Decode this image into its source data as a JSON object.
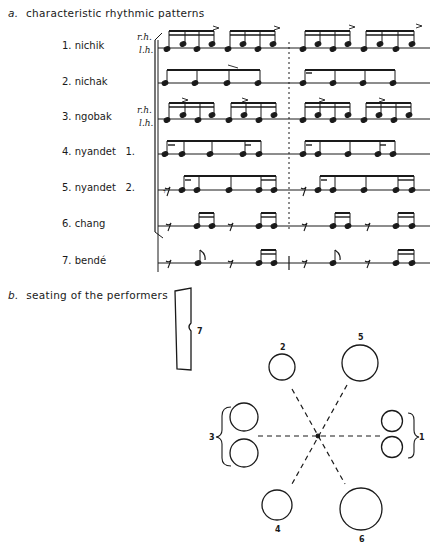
{
  "section_a": {
    "letter": "a.",
    "title": "characteristic rhythmic patterns"
  },
  "section_b": {
    "letter": "b.",
    "title": "seating of the performers"
  },
  "instruments": [
    {
      "number": "1.",
      "name": "nichik",
      "label": "1. nichik",
      "hands": [
        "r.h.",
        "l.h."
      ],
      "staff_y": 48
    },
    {
      "number": "2.",
      "name": "nichak",
      "label": "2. nichak",
      "hands": [],
      "staff_y": 83
    },
    {
      "number": "3.",
      "name": "ngobak",
      "label": "3. ngobak",
      "hands": [
        "r.h.",
        "l.h."
      ],
      "staff_y": 119
    },
    {
      "number": "4.",
      "name": "nyandet 1.",
      "label": "4. nyandet   1.",
      "hands": [],
      "staff_y": 154
    },
    {
      "number": "5.",
      "name": "nyandet 2.",
      "label": "5. nyandet   2.",
      "hands": [],
      "staff_y": 190
    },
    {
      "number": "6.",
      "name": "chang",
      "label": "6. chang",
      "hands": [],
      "staff_y": 226
    },
    {
      "number": "7.",
      "name": "bendé",
      "label": "7. bendé",
      "hands": [],
      "staff_y": 263
    }
  ],
  "notation": {
    "staff_x_start": 157,
    "staff_x_end": 430,
    "barline_x": 290,
    "barline_style_1_6": "dashed",
    "barline_style_7": "solid",
    "bracket_groups": [
      "1-6",
      "7"
    ]
  },
  "seating": {
    "center": [
      318,
      436
    ],
    "performers": [
      {
        "id": "1",
        "label": "1",
        "circles": [
          [
            392,
            421,
            10
          ],
          [
            392,
            447,
            10
          ]
        ],
        "brace": "right",
        "label_pos": [
          418,
          437
        ]
      },
      {
        "id": "2",
        "label": "2",
        "circles": [
          [
            282,
            367,
            13
          ]
        ],
        "label_pos": [
          282,
          349
        ]
      },
      {
        "id": "3",
        "label": "3",
        "circles": [
          [
            244,
            417,
            14
          ],
          [
            244,
            453,
            14
          ]
        ],
        "brace": "left",
        "label_pos": [
          212,
          437
        ]
      },
      {
        "id": "4",
        "label": "4",
        "circles": [
          [
            277,
            505,
            15
          ]
        ],
        "label_pos": [
          277,
          530
        ]
      },
      {
        "id": "5",
        "label": "5",
        "circles": [
          [
            360,
            363,
            18
          ]
        ],
        "label_pos": [
          360,
          338
        ]
      },
      {
        "id": "6",
        "label": "6",
        "circles": [
          [
            361,
            509,
            21
          ]
        ],
        "label_pos": [
          361,
          540
        ]
      },
      {
        "id": "7",
        "label": "7",
        "shape": "bench",
        "label_pos": [
          198,
          331
        ]
      }
    ]
  }
}
